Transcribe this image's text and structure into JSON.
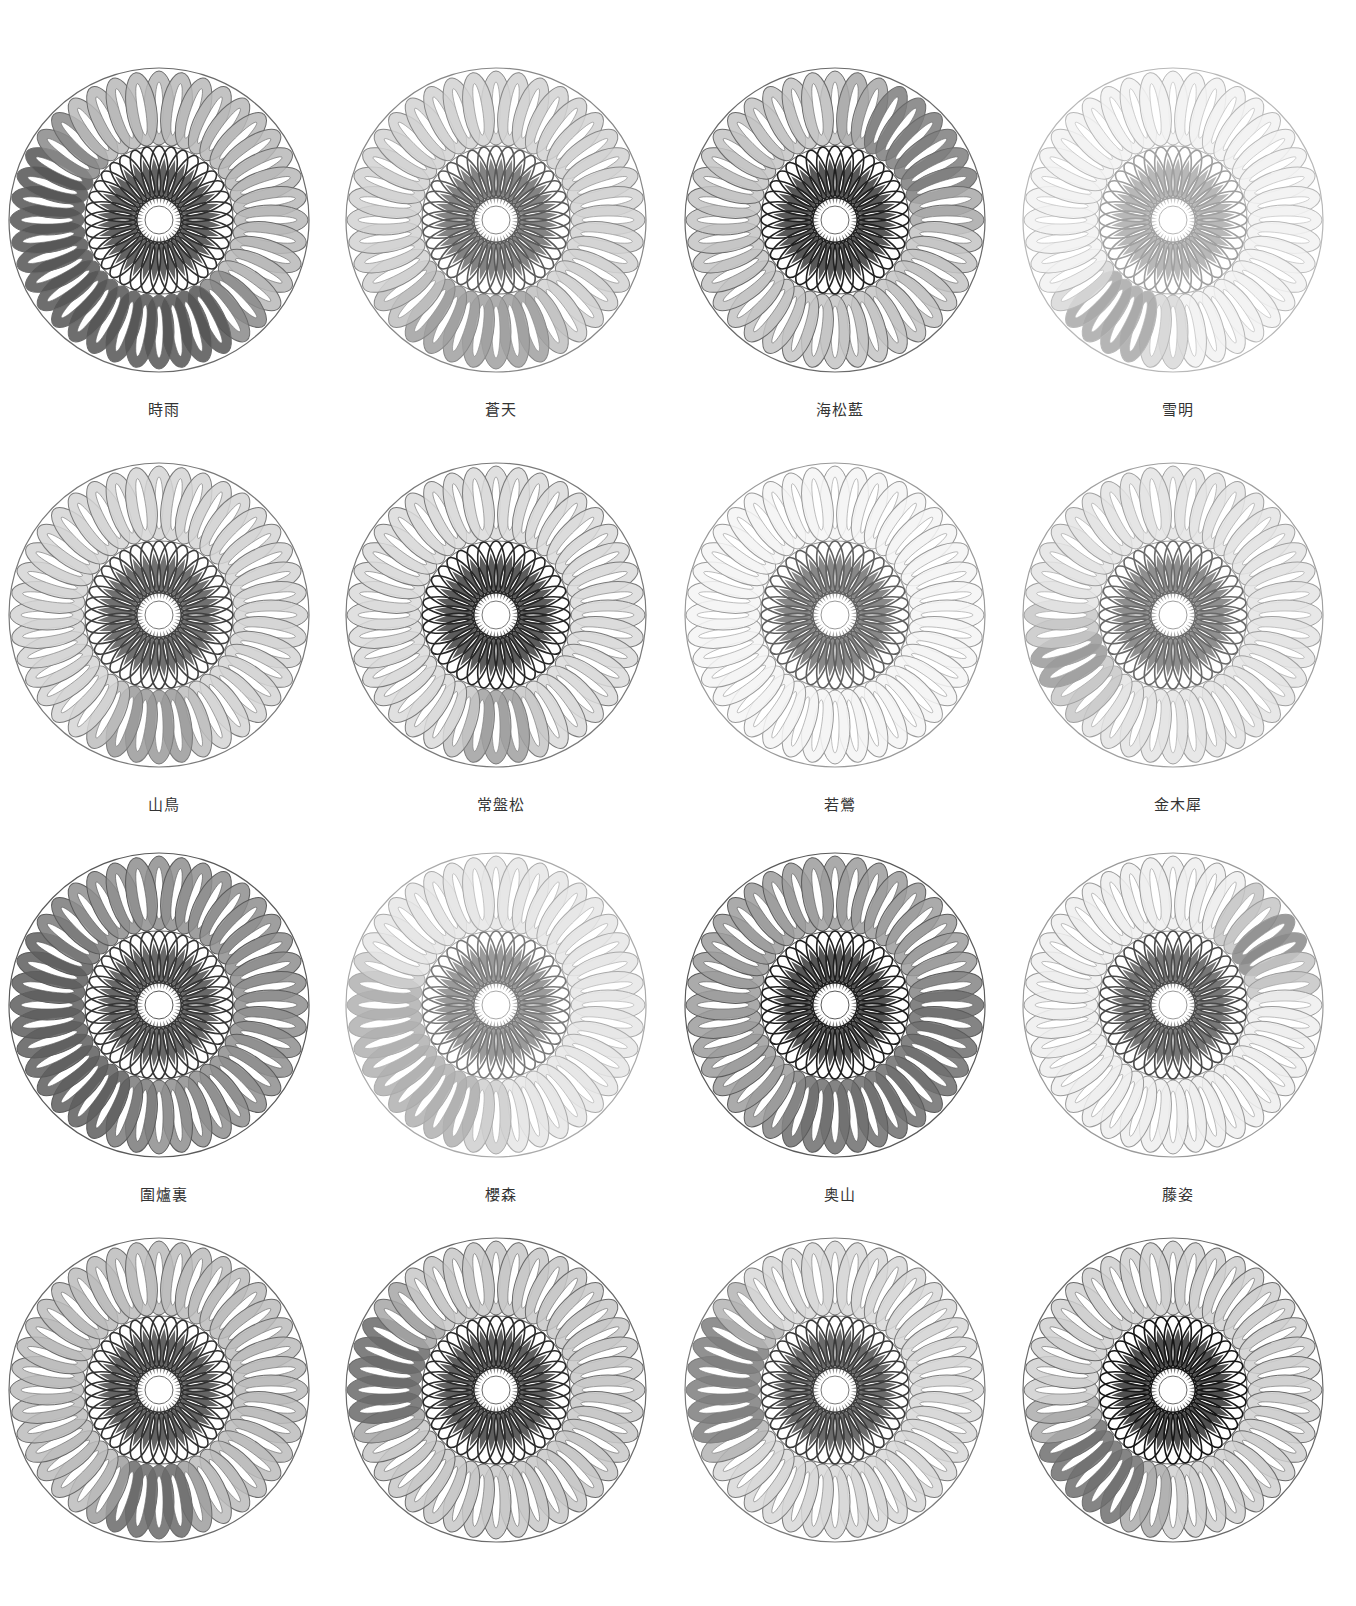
{
  "swatches": [
    {
      "label": "時雨",
      "petal_tones": {
        "base": "#b9b9b9",
        "dark_arc": [
          150,
          300
        ],
        "dark": "#555555",
        "mid": "#8a8a8a"
      },
      "inner": "#2e2e2e",
      "line": "#6a6a6a"
    },
    {
      "label": "蒼天",
      "petal_tones": {
        "base": "#d2d2d2",
        "dark_arc": [
          160,
          220
        ],
        "dark": "#a0a0a0",
        "mid": "#c0c0c0"
      },
      "inner": "#5a5a5a",
      "line": "#888888"
    },
    {
      "label": "海松藍",
      "petal_tones": {
        "base": "#c4c4c4",
        "dark_arc": [
          20,
          80
        ],
        "dark": "#7e7e7e",
        "mid": "#a8a8a8"
      },
      "inner": "#202020",
      "line": "#6a6a6a"
    },
    {
      "label": "雪明",
      "petal_tones": {
        "base": "#f2f2f2",
        "dark_arc": [
          190,
          225
        ],
        "dark": "#a8a8a8",
        "mid": "#d8d8d8"
      },
      "inner": "#a0a0a0",
      "line": "#b8b8b8"
    },
    {
      "label": "山鳥",
      "petal_tones": {
        "base": "#d5d5d5",
        "dark_arc": [
          170,
          200
        ],
        "dark": "#9a9a9a",
        "mid": "#bdbdbd"
      },
      "inner": "#404040",
      "line": "#7a7a7a"
    },
    {
      "label": "常盤松",
      "petal_tones": {
        "base": "#dadada",
        "dark_arc": [
          170,
          190
        ],
        "dark": "#a0a0a0",
        "mid": "#c6c6c6"
      },
      "inner": "#262626",
      "line": "#7a7a7a"
    },
    {
      "label": "若鶯",
      "petal_tones": {
        "base": "#f4f4f4",
        "dark_arc": [
          0,
          0
        ],
        "dark": "#d0d0d0",
        "mid": "#e6e6e6"
      },
      "inner": "#606060",
      "line": "#9a9a9a"
    },
    {
      "label": "金木犀",
      "petal_tones": {
        "base": "#e4e4e4",
        "dark_arc": [
          240,
          260
        ],
        "dark": "#9a9a9a",
        "mid": "#c8c8c8"
      },
      "inner": "#6a6a6a",
      "line": "#a0a0a0"
    },
    {
      "label": "圍爐裏",
      "petal_tones": {
        "base": "#8e8e8e",
        "dark_arc": [
          200,
          300
        ],
        "dark": "#5e5e5e",
        "mid": "#7a7a7a"
      },
      "inner": "#353535",
      "line": "#5a5a5a"
    },
    {
      "label": "櫻森",
      "petal_tones": {
        "base": "#e6e6e6",
        "dark_arc": [
          190,
          280
        ],
        "dark": "#b0b0b0",
        "mid": "#cfcfcf"
      },
      "inner": "#7a7a7a",
      "line": "#aaaaaa"
    },
    {
      "label": "奥山",
      "petal_tones": {
        "base": "#9c9c9c",
        "dark_arc": [
          90,
          200
        ],
        "dark": "#6e6e6e",
        "mid": "#858585"
      },
      "inner": "#1e1e1e",
      "line": "#5a5a5a"
    },
    {
      "label": "藤姿",
      "petal_tones": {
        "base": "#efefef",
        "dark_arc": [
          50,
          70
        ],
        "dark": "#8a8a8a",
        "mid": "#c6c6c6"
      },
      "inner": "#4a4a4a",
      "line": "#9a9a9a"
    },
    {
      "label": "",
      "petal_tones": {
        "base": "#bcbcbc",
        "dark_arc": [
          170,
          200
        ],
        "dark": "#6a6a6a",
        "mid": "#9e9e9e"
      },
      "inner": "#303030",
      "line": "#6a6a6a"
    },
    {
      "label": "",
      "petal_tones": {
        "base": "#c8c8c8",
        "dark_arc": [
          260,
          300
        ],
        "dark": "#6a6a6a",
        "mid": "#a6a6a6"
      },
      "inner": "#2a2a2a",
      "line": "#6a6a6a"
    },
    {
      "label": "",
      "petal_tones": {
        "base": "#d8d8d8",
        "dark_arc": [
          250,
          300
        ],
        "dark": "#7e7e7e",
        "mid": "#b4b4b4"
      },
      "inner": "#3a3a3a",
      "line": "#7a7a7a"
    },
    {
      "label": "",
      "petal_tones": {
        "base": "#d0d0d0",
        "dark_arc": [
          200,
          250
        ],
        "dark": "#707070",
        "mid": "#ababab"
      },
      "inner": "#151515",
      "line": "#6a6a6a"
    }
  ],
  "layout": {
    "columns_x": [
      4,
      341,
      680,
      1018
    ],
    "rows_y": [
      60,
      455,
      845,
      1230
    ],
    "label_y_offset": 338
  }
}
